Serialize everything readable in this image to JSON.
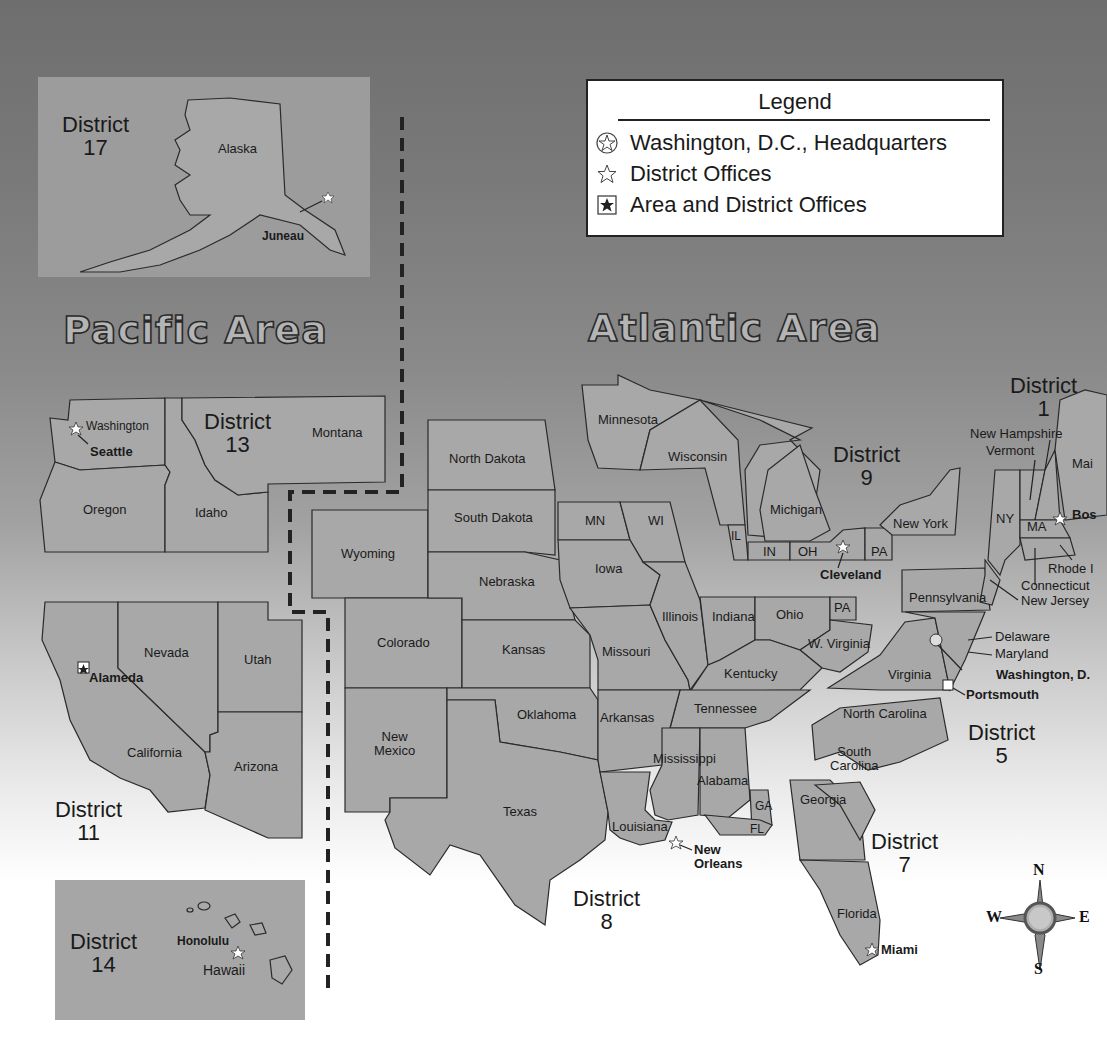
{
  "legend": {
    "title": "Legend",
    "items": [
      {
        "icon": "circled-star-icon",
        "label": "Washington, D.C., Headquarters"
      },
      {
        "icon": "star-outline-icon",
        "label": "District Offices"
      },
      {
        "icon": "boxed-star-icon",
        "label": "Area and District Offices"
      }
    ]
  },
  "areas": {
    "pacific": "Pacific Area",
    "atlantic": "Atlantic Area"
  },
  "districts": {
    "d1": {
      "name": "District",
      "number": "1"
    },
    "d5": {
      "name": "District",
      "number": "5"
    },
    "d7": {
      "name": "District",
      "number": "7"
    },
    "d8": {
      "name": "District",
      "number": "8"
    },
    "d9": {
      "name": "District",
      "number": "9"
    },
    "d11": {
      "name": "District",
      "number": "11"
    },
    "d13": {
      "name": "District",
      "number": "13"
    },
    "d14": {
      "name": "District",
      "number": "14"
    },
    "d17": {
      "name": "District",
      "number": "17"
    }
  },
  "states": {
    "alaska": "Alaska",
    "washington": "Washington",
    "oregon": "Oregon",
    "idaho": "Idaho",
    "montana": "Montana",
    "california": "California",
    "nevada": "Nevada",
    "utah": "Utah",
    "arizona": "Arizona",
    "hawaii": "Hawaii",
    "wyoming": "Wyoming",
    "colorado": "Colorado",
    "new_mexico": "New\nMexico",
    "north_dakota": "North Dakota",
    "south_dakota": "South Dakota",
    "nebraska": "Nebraska",
    "kansas": "Kansas",
    "oklahoma": "Oklahoma",
    "texas": "Texas",
    "minnesota": "Minnesota",
    "wisconsin": "Wisconsin",
    "michigan": "Michigan",
    "new_york": "New York",
    "mn": "MN",
    "wi": "WI",
    "il": "IL",
    "in": "IN",
    "oh": "OH",
    "pa": "PA",
    "pa2": "PA",
    "iowa": "Iowa",
    "missouri": "Missouri",
    "illinois": "Illinois",
    "indiana": "Indiana",
    "ohio": "Ohio",
    "w_virginia": "W. Virginia",
    "kentucky": "Kentucky",
    "tennessee": "Tennessee",
    "arkansas": "Arkansas",
    "louisiana": "Louisiana",
    "mississippi": "Mississippi",
    "alabama": "Alabama",
    "ga": "GA",
    "fl": "FL",
    "georgia": "Georgia",
    "south_carolina": "South\nCarolina",
    "north_carolina": "North Carolina",
    "virginia": "Virginia",
    "pennsylvania": "Pennsylvania",
    "delaware": "Delaware",
    "maryland": "Maryland",
    "new_jersey": "New Jersey",
    "connecticut": "Connecticut",
    "rhode": "Rhode I",
    "ny": "NY",
    "ma": "MA",
    "vermont": "Vermont",
    "new_hampshire": "New Hampshire",
    "maine": "Mai",
    "florida": "Florida"
  },
  "cities": {
    "juneau": "Juneau",
    "seattle": "Seattle",
    "alameda": "Alameda",
    "honolulu": "Honolulu",
    "cleveland": "Cleveland",
    "new_orleans": "New\nOrleans",
    "miami": "Miami",
    "portsmouth": "Portsmouth",
    "washington_dc": "Washington, D.",
    "boston": "Bos"
  },
  "compass": {
    "n": "N",
    "s": "S",
    "e": "E",
    "w": "W"
  },
  "colors": {
    "land": "#a8a8a8",
    "border": "#2a2a2a",
    "legend_bg": "#ffffff",
    "background_top": "#6e6e6e",
    "background_bottom": "#ffffff"
  }
}
